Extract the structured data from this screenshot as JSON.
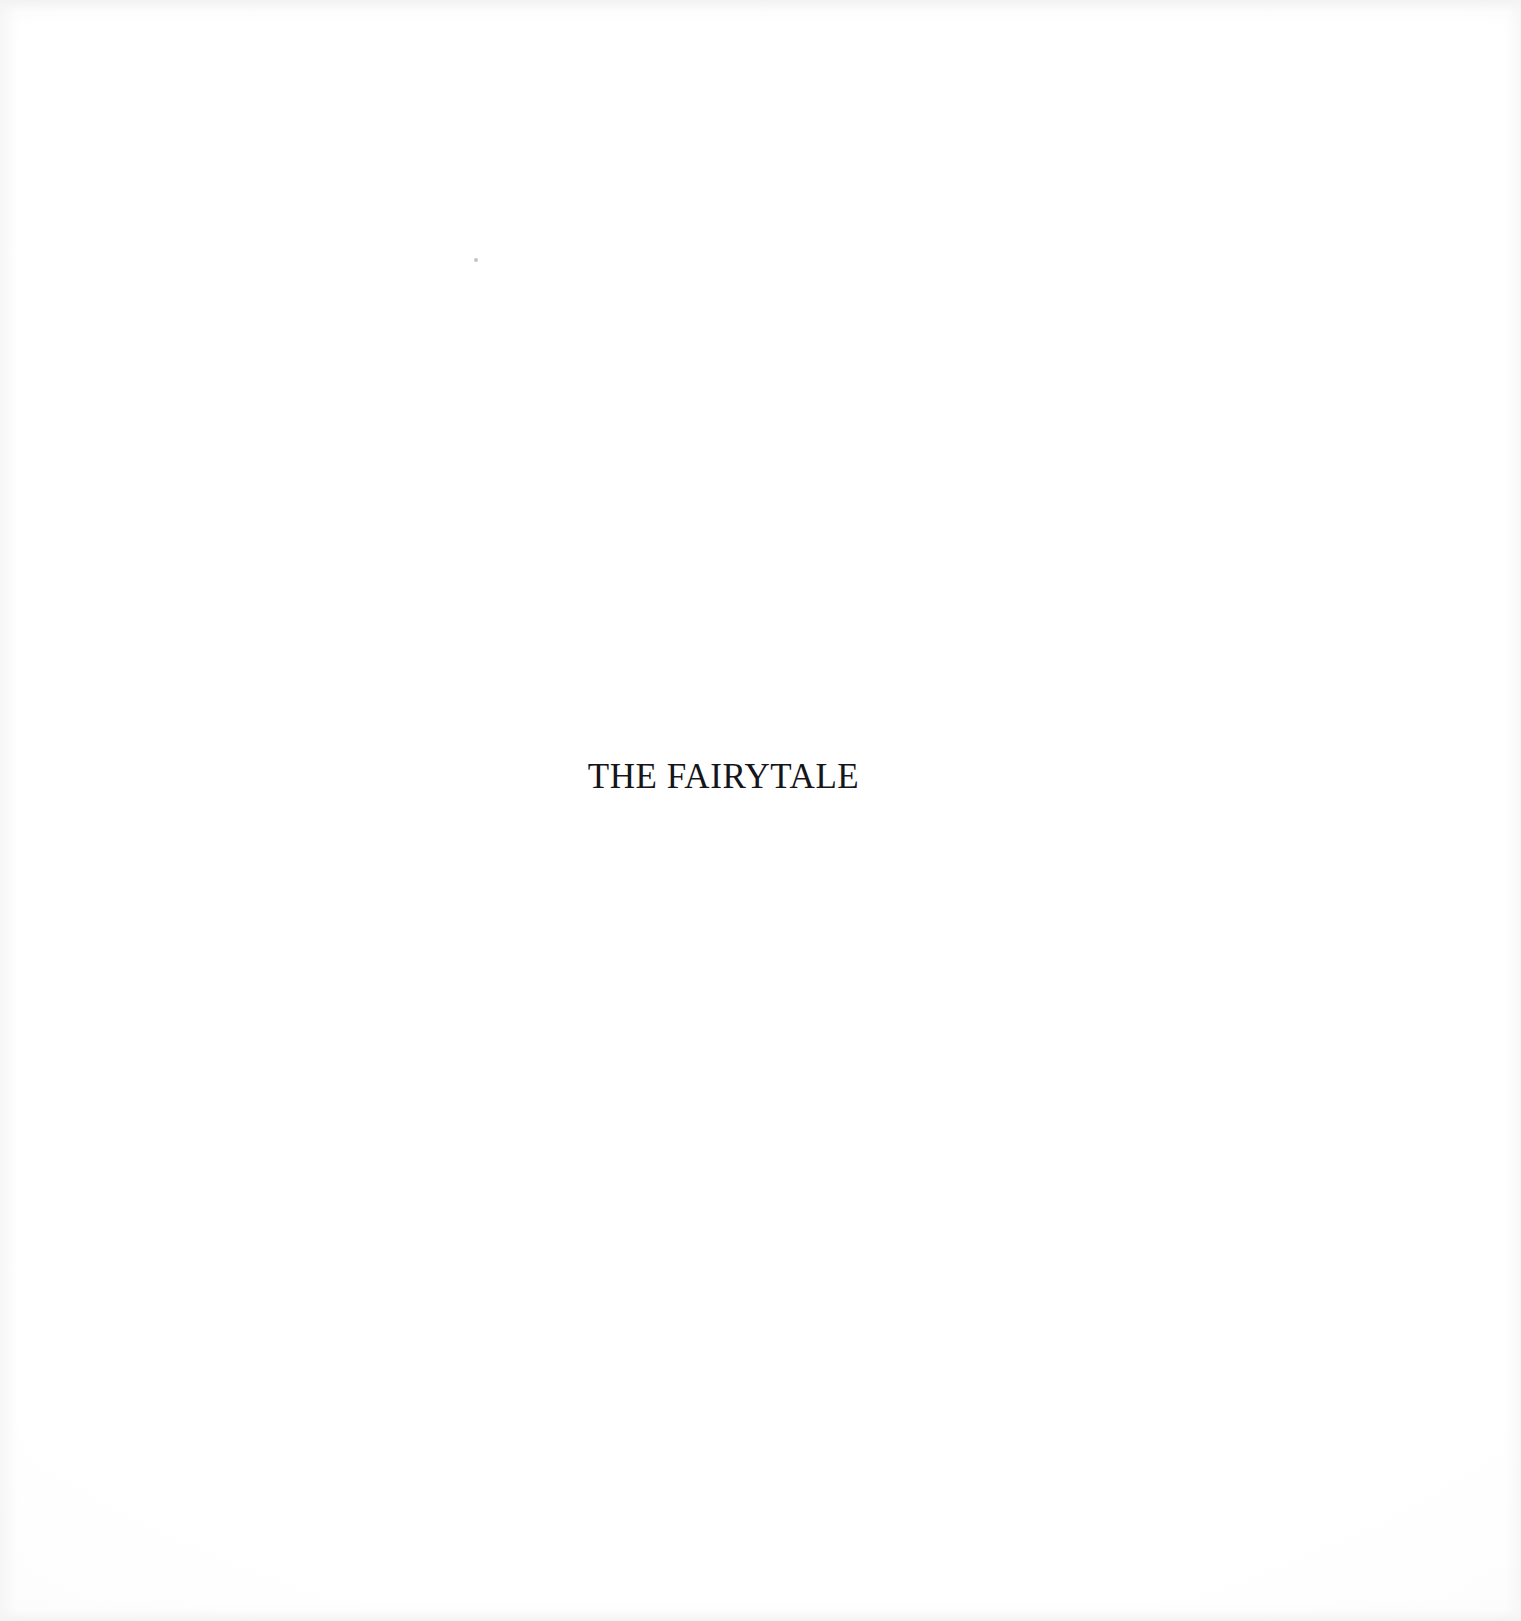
{
  "document": {
    "kind": "scanned-book-page",
    "page_type": "part-title",
    "background_color": "#ffffff",
    "text_color": "#15161a"
  },
  "page": {
    "heading": "THE FAIRYTALE"
  },
  "artifacts": {
    "speck_label": "",
    "edge_label": ""
  }
}
